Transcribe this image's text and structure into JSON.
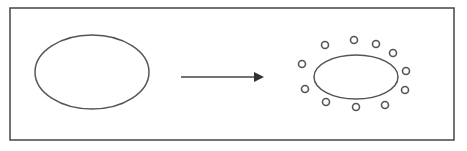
{
  "diagram": {
    "colors": {
      "stroke": "#555555",
      "frame": "#444444",
      "background": "#ffffff"
    },
    "frame": {
      "x": 10,
      "y": 8,
      "width": 444,
      "height": 132
    },
    "left_ellipse": {
      "cx": 92,
      "cy": 72,
      "rx": 57,
      "ry": 37
    },
    "arrow": {
      "x1": 181,
      "y1": 77,
      "x2": 262,
      "y2": 77
    },
    "right_ellipse": {
      "cx": 356,
      "cy": 77,
      "rx": 42,
      "ry": 22
    },
    "particles": [
      {
        "cx": 325,
        "cy": 45
      },
      {
        "cx": 354,
        "cy": 40
      },
      {
        "cx": 376,
        "cy": 44
      },
      {
        "cx": 393,
        "cy": 53
      },
      {
        "cx": 302,
        "cy": 64
      },
      {
        "cx": 406,
        "cy": 71
      },
      {
        "cx": 305,
        "cy": 89
      },
      {
        "cx": 405,
        "cy": 90
      },
      {
        "cx": 326,
        "cy": 102
      },
      {
        "cx": 356,
        "cy": 107
      },
      {
        "cx": 385,
        "cy": 105
      }
    ],
    "particle_radius": 3.5
  }
}
